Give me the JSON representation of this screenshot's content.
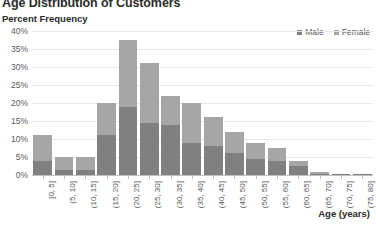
{
  "chart_data": {
    "type": "bar",
    "barmode": "stacked",
    "title": "Age Distribution of Customers",
    "xlabel": "Age (years)",
    "ylabel": "Percent Frequency",
    "categories": [
      "[0, 5]",
      "(5, 10]",
      "(10, 15]",
      "(15, 20]",
      "(20, 25]",
      "(25, 30]",
      "(30, 35]",
      "(35, 40]",
      "(40, 45]",
      "(45, 50]",
      "(50, 55]",
      "(55, 60]",
      "(60, 65]",
      "(65, 70]",
      "(70, 75]",
      "(75, 80]"
    ],
    "series": [
      {
        "name": "Male",
        "color": "#808080",
        "values": [
          4.0,
          1.5,
          1.5,
          11.0,
          19.0,
          14.5,
          14.0,
          9.0,
          8.0,
          6.0,
          4.5,
          4.0,
          2.5,
          0.4,
          0.2,
          0.2
        ]
      },
      {
        "name": "Female",
        "color": "#a6a6a6",
        "values": [
          7.0,
          3.5,
          3.5,
          9.0,
          18.5,
          16.5,
          8.0,
          11.0,
          8.0,
          6.0,
          4.5,
          3.5,
          1.5,
          0.3,
          0.2,
          0.1
        ]
      }
    ],
    "totals": [
      11.0,
      5.0,
      5.0,
      20.0,
      37.5,
      31.0,
      22.0,
      20.0,
      16.0,
      12.0,
      9.0,
      7.5,
      4.0,
      0.7,
      0.4,
      0.3
    ],
    "yticks": [
      "0%",
      "5%",
      "10%",
      "15%",
      "20%",
      "25%",
      "30%",
      "35%",
      "40%"
    ],
    "ytick_values": [
      0,
      5,
      10,
      15,
      20,
      25,
      30,
      35,
      40
    ],
    "ylim": [
      0,
      40
    ],
    "grid": true,
    "legend_position": "top-right",
    "value_unit": "%"
  },
  "legend": {
    "items": [
      {
        "label": "Male",
        "color": "#808080"
      },
      {
        "label": "Female",
        "color": "#a6a6a6"
      }
    ]
  }
}
